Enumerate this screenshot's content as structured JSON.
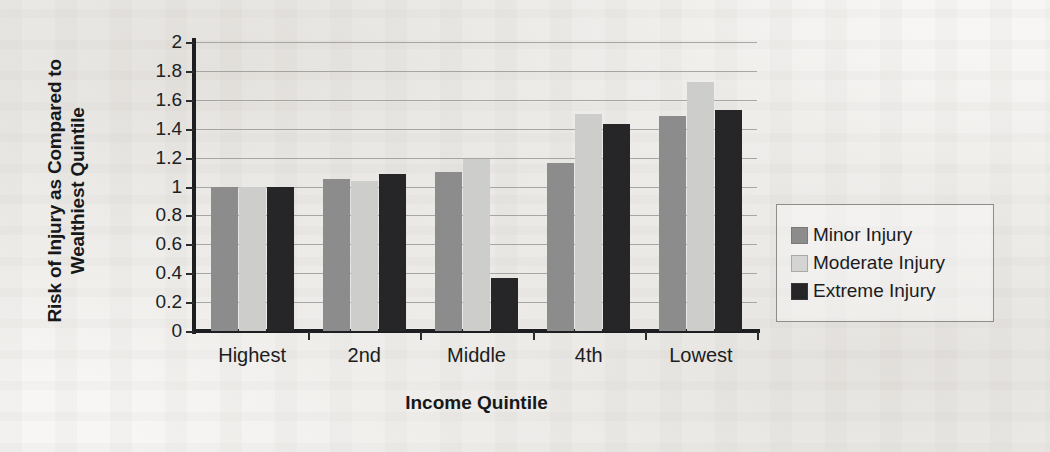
{
  "chart_data": {
    "type": "bar",
    "title": "",
    "xlabel": "Income Quintile",
    "ylabel": "Risk of Injury as Compared to Wealthiest Quintile",
    "ylabel_line1": "Risk of Injury as Compared to",
    "ylabel_line2": "Wealthiest Quintile",
    "categories": [
      "Highest",
      "2nd",
      "Middle",
      "4th",
      "Lowest"
    ],
    "series": [
      {
        "name": "Minor Injury",
        "color": "#8c8c8c",
        "values": [
          1.0,
          1.05,
          1.1,
          1.16,
          1.49
        ]
      },
      {
        "name": "Moderate Injury",
        "color": "#cdcdcb",
        "values": [
          1.0,
          1.04,
          1.19,
          1.5,
          1.72
        ]
      },
      {
        "name": "Extreme Injury",
        "color": "#262628",
        "values": [
          1.0,
          1.09,
          0.37,
          1.43,
          1.53
        ]
      }
    ],
    "ylim": [
      0,
      2
    ],
    "ytick_values": [
      2,
      1.8,
      1.6,
      1.4,
      1.2,
      1,
      0.8,
      0.6,
      0.4,
      0.2,
      0
    ],
    "ytick_labels": [
      "2",
      "1.8",
      "1.6",
      "1.4",
      "1.2",
      "1",
      "0.8",
      "0.6",
      "0.4",
      "0.2",
      "0"
    ],
    "grid": true,
    "gridline_values": [
      2,
      1.8,
      1.6,
      1.4,
      1.2,
      1,
      0.8,
      0.6,
      0.4,
      0.2
    ],
    "legend_position": "right",
    "legend_entries": [
      "Minor Injury",
      "Moderate Injury",
      "Extreme Injury"
    ]
  }
}
